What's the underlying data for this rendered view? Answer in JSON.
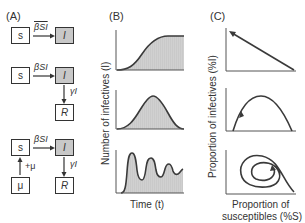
{
  "panels": {
    "A": {
      "label": "(A)",
      "models": [
        {
          "name": "SI",
          "compartments": [
            "S",
            "I"
          ],
          "transitions": [
            {
              "from": "S",
              "to": "I",
              "rate": "βSI"
            }
          ]
        },
        {
          "name": "SIR",
          "compartments": [
            "S",
            "I",
            "R"
          ],
          "transitions": [
            {
              "from": "S",
              "to": "I",
              "rate": "βSI"
            },
            {
              "from": "I",
              "to": "R",
              "rate": "γI"
            }
          ]
        },
        {
          "name": "SIR with births",
          "compartments": [
            "μ",
            "S",
            "I",
            "R"
          ],
          "transitions": [
            {
              "from": "μ",
              "to": "S",
              "rate": "+μ"
            },
            {
              "from": "S",
              "to": "I",
              "rate": "βSI"
            },
            {
              "from": "I",
              "to": "R",
              "rate": "γI"
            }
          ]
        }
      ],
      "text": {
        "s": "s",
        "i": "I",
        "r": "R",
        "mu": "μ",
        "beta_si": "βSI",
        "gamma_i": "γI",
        "plus_mu": "+μ"
      }
    },
    "B": {
      "label": "(B)",
      "ylabel": "Number of infectives (I)",
      "xlabel": "Time (t)",
      "plots": [
        {
          "shape": "logistic rise to plateau"
        },
        {
          "shape": "single epidemic peak"
        },
        {
          "shape": "damped oscillations"
        }
      ]
    },
    "C": {
      "label": "(C)",
      "ylabel": "Proportion of infectives (%I)",
      "xlabel_line1": "Proportion of",
      "xlabel_line2": "susceptibles (%S)",
      "plots": [
        {
          "shape": "straight line toward high I / low S"
        },
        {
          "shape": "arch trajectory"
        },
        {
          "shape": "inward spiral"
        }
      ]
    }
  },
  "colors": {
    "line": "#3a3a3a",
    "fill": "#c8c8c8",
    "box_fill": "#c8c8c8",
    "text": "#333333"
  }
}
